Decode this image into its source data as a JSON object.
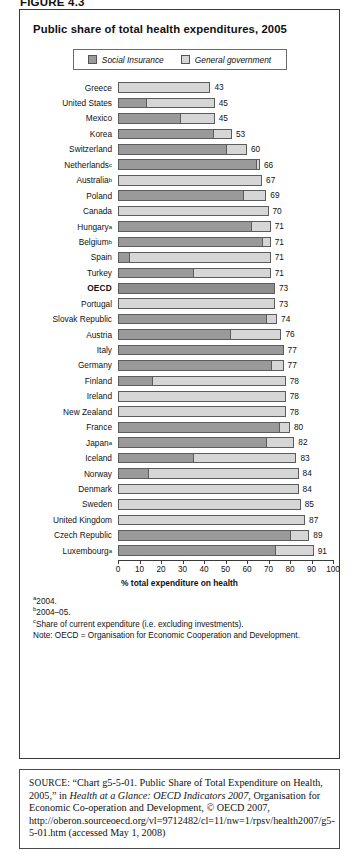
{
  "figure": {
    "label": "FIGURE 4.3",
    "title": "Public share of total health expenditures, 2005"
  },
  "legend": {
    "items": [
      {
        "label": "Social Insurance",
        "color": "#9a9a9a",
        "icon": "legend-swatch-social-insurance"
      },
      {
        "label": "General government",
        "color": "#d6d6d6",
        "icon": "legend-swatch-general-government"
      }
    ]
  },
  "chart_data": {
    "type": "bar",
    "orientation": "horizontal",
    "stacked": true,
    "title": "Public share of total health expenditures, 2005",
    "xlabel": "% total expenditure on health",
    "ylabel": "",
    "xlim": [
      0,
      100
    ],
    "xticks": [
      0,
      10,
      20,
      30,
      40,
      50,
      60,
      70,
      80,
      90,
      100
    ],
    "grid": false,
    "legend_position": "top",
    "categories": [
      "Greece",
      "United States",
      "Mexico",
      "Korea",
      "Switzerland",
      "Netherlandsᶜ",
      "Australiaᵇ",
      "Poland",
      "Canada",
      "Hungaryᵃ",
      "Belgiumᵇ",
      "Spain",
      "Turkey",
      "OECD",
      "Portugal",
      "Slovak Republic",
      "Austria",
      "Italy",
      "Germany",
      "Finland",
      "Ireland",
      "New Zealand",
      "France",
      "Japanᵃ",
      "Iceland",
      "Norway",
      "Denmark",
      "Sweden",
      "United Kingdom",
      "Czech Republic",
      "Luxembourgᵃ"
    ],
    "series": [
      {
        "name": "Social Insurance",
        "color": "#9a9a9a",
        "values": [
          0,
          13,
          29,
          44,
          50,
          64,
          0,
          58,
          0,
          62,
          67,
          5,
          35,
          73,
          0,
          69,
          52,
          77,
          71,
          16,
          0,
          0,
          75,
          69,
          35,
          14,
          0,
          0,
          0,
          80,
          73
        ]
      },
      {
        "name": "General government",
        "color": "#d6d6d6",
        "values": [
          43,
          32,
          16,
          9,
          10,
          2,
          67,
          11,
          70,
          9,
          4,
          66,
          36,
          0,
          73,
          5,
          24,
          0,
          6,
          62,
          78,
          78,
          5,
          13,
          48,
          70,
          84,
          85,
          87,
          9,
          18
        ]
      }
    ],
    "totals": [
      43,
      45,
      45,
      53,
      60,
      66,
      67,
      69,
      70,
      71,
      71,
      71,
      71,
      73,
      73,
      74,
      76,
      77,
      77,
      78,
      78,
      78,
      80,
      82,
      83,
      84,
      84,
      85,
      87,
      89,
      91
    ],
    "highlight_category": "OECD"
  },
  "notes": {
    "a": "2004.",
    "b": "2004–05.",
    "c": "Share of current expenditure (i.e. excluding investments).",
    "note": "Note: OECD = Organisation for Economic Cooperation and Development."
  },
  "source": {
    "label": "SOURCE:",
    "part1": "“Chart g5-5-01. Public Share of Total Expenditure on Health, 2005,” in ",
    "italic": "Health at a Glance: OECD Indicators 2007",
    "part2": ", Organisation for Economic Co-operation and Development, © OECD 2007, http://oberon.sourceoecd.org/vl=9712482/cl=11/nw=1/rpsv/health2007/g5-5-01.htm (accessed May 1, 2008)"
  }
}
